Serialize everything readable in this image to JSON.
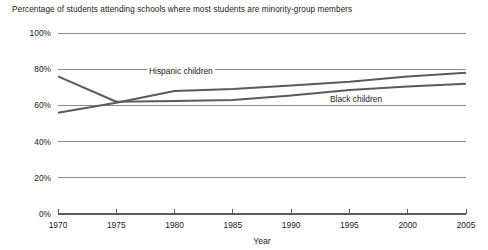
{
  "chart_data": {
    "type": "line",
    "title": "Percentage of students attending schools where most students are minority-group members",
    "xlabel": "Year",
    "ylabel": "",
    "xlim": [
      1970,
      2005
    ],
    "ylim": [
      0,
      100
    ],
    "grid": true,
    "legend_position": "inline-labels",
    "x": [
      1970,
      1975,
      1980,
      1985,
      1990,
      1995,
      2000,
      2005
    ],
    "xtick_labels": [
      "1970",
      "1975",
      "1980",
      "1985",
      "1990",
      "1995",
      "2000",
      "2005"
    ],
    "ytick_values": [
      0,
      20,
      40,
      60,
      80,
      100
    ],
    "ytick_labels": [
      "0%",
      "20%",
      "40%",
      "60%",
      "80%",
      "100%"
    ],
    "series": [
      {
        "name": "Black children",
        "color": "#5b5b5b",
        "values": [
          76,
          62,
          62.5,
          63,
          65.5,
          68.5,
          70.5,
          72
        ]
      },
      {
        "name": "Hispanic children",
        "color": "#5b5b5b",
        "values": [
          56,
          61.5,
          68,
          69,
          71,
          73,
          76,
          78
        ]
      }
    ],
    "annotations": [
      {
        "text": "Hispanic children",
        "series": "Hispanic children"
      },
      {
        "text": "Black children",
        "series": "Black children"
      }
    ]
  }
}
